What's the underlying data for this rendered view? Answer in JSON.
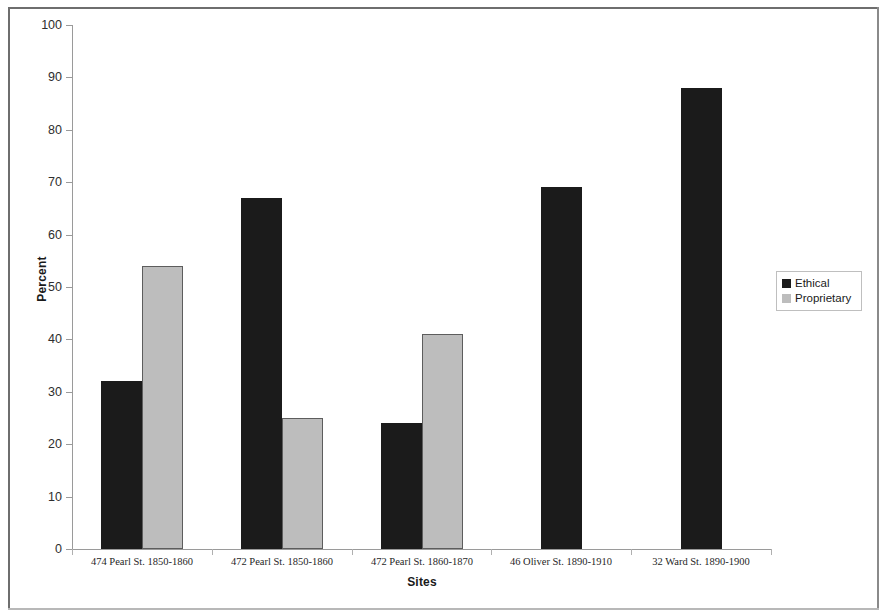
{
  "chart_data": {
    "type": "bar",
    "title": "",
    "xlabel": "Sites",
    "ylabel": "Percent",
    "ylim": [
      0,
      100
    ],
    "ytick_step": 10,
    "yticks": [
      0,
      10,
      20,
      30,
      40,
      50,
      60,
      70,
      80,
      90,
      100
    ],
    "grid": false,
    "legend_position": "right",
    "categories": [
      "474 Pearl St. 1850-1860",
      "472 Pearl St. 1850-1860",
      "472 Pearl St. 1860-1870",
      "46 Oliver St. 1890-1910",
      "32 Ward St. 1890-1900"
    ],
    "series": [
      {
        "name": "Ethical",
        "color": "#1b1b1b",
        "values": [
          32,
          67,
          24,
          69,
          88
        ]
      },
      {
        "name": "Proprietary",
        "color": "#bdbdbd",
        "values": [
          54,
          25,
          41,
          null,
          null
        ]
      }
    ]
  },
  "legend": {
    "items": [
      {
        "label": "Ethical",
        "swatch": "ethical"
      },
      {
        "label": "Proprietary",
        "swatch": "proprietary"
      }
    ]
  }
}
